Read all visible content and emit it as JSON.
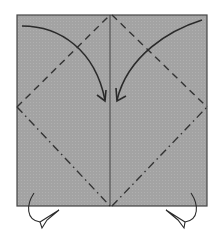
{
  "diagram": {
    "type": "origami-fold-instruction",
    "colors": {
      "paper": "#a3a3a3",
      "line": "#333333",
      "background": "#ffffff"
    },
    "paper": {
      "x": 17,
      "y": 15,
      "width": 190,
      "height": 191
    },
    "center_crease": {
      "x": 110
    },
    "valley_folds": [
      {
        "from": [
          17,
          107
        ],
        "to": [
          110,
          15
        ]
      },
      {
        "from": [
          110,
          15
        ],
        "to": [
          207,
          107
        ]
      }
    ],
    "mountain_folds": [
      {
        "from": [
          17,
          107
        ],
        "to": [
          110,
          206
        ]
      },
      {
        "from": [
          110,
          206
        ],
        "to": [
          207,
          107
        ]
      }
    ],
    "fold_arrows": [
      {
        "direction": "left-corner-to-center",
        "style": "valley"
      },
      {
        "direction": "right-corner-to-center",
        "style": "valley"
      }
    ],
    "push_arrows": [
      {
        "side": "bottom-left",
        "style": "mountain-fold-behind"
      },
      {
        "side": "bottom-right",
        "style": "mountain-fold-behind"
      }
    ]
  }
}
